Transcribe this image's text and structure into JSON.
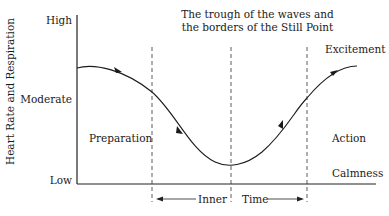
{
  "title": {
    "line1": "The trough of the waves and",
    "line2": "the borders of the Still Point"
  },
  "y_axis": {
    "label": "Heart Rate and Respiration",
    "ticks": {
      "high": "High",
      "moderate": "Moderate",
      "low": "Low"
    }
  },
  "regions": {
    "preparation": "Preparation",
    "action": "Action",
    "excitement": "Excitement",
    "calmness": "Calmness"
  },
  "inner_time": {
    "left": "Inner",
    "right": "Time"
  },
  "colors": {
    "line": "#1a1a1a",
    "background": "#ffffff"
  }
}
